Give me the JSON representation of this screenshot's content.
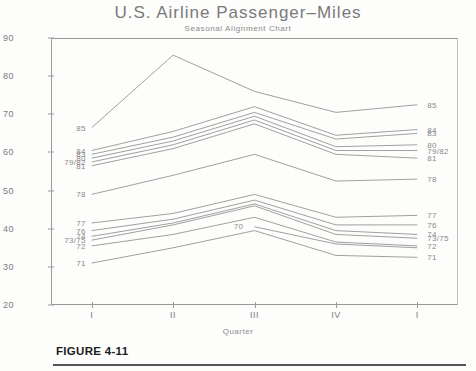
{
  "figure": {
    "caption": "FIGURE 4-11"
  },
  "chart_data": {
    "type": "line",
    "title": "U.S. Airline Passenger–Miles",
    "subtitle": "Seasonal Alignment Chart",
    "xlabel": "Quarter",
    "ylabel": "",
    "grid": false,
    "legend_position": "inline-endpoints",
    "x": [
      "I",
      "II",
      "III",
      "IV",
      "I"
    ],
    "xtick_labels": [
      "I",
      "II",
      "III",
      "IV",
      "I"
    ],
    "ytick_labels": [
      "20",
      "30",
      "40",
      "50",
      "60",
      "70",
      "80",
      "90"
    ],
    "ytick_values": [
      20,
      30,
      40,
      50,
      60,
      70,
      80,
      90
    ],
    "ylim": [
      20,
      90
    ],
    "series": [
      {
        "name": "85",
        "label_left": "85",
        "label_right": "85",
        "values": [
          66.5,
          85.5,
          76.0,
          70.5,
          72.5
        ]
      },
      {
        "name": "84",
        "label_left": "84",
        "label_right": "84",
        "values": [
          60.5,
          65.5,
          72.0,
          64.5,
          66.0
        ]
      },
      {
        "name": "83",
        "label_left": "83",
        "label_right": "83",
        "values": [
          59.5,
          64.0,
          70.5,
          63.5,
          65.0
        ]
      },
      {
        "name": "80",
        "label_left": "80",
        "label_right": "80",
        "values": [
          58.5,
          63.0,
          69.5,
          61.5,
          62.0
        ]
      },
      {
        "name": "79/82",
        "label_left": "79/82",
        "label_right": "79/82",
        "values": [
          57.5,
          62.0,
          68.5,
          60.5,
          60.5
        ]
      },
      {
        "name": "81",
        "label_left": "81",
        "label_right": "81",
        "values": [
          56.5,
          61.0,
          67.5,
          59.5,
          58.5
        ]
      },
      {
        "name": "78",
        "label_left": "78",
        "label_right": "78",
        "values": [
          49.0,
          54.0,
          59.5,
          52.5,
          53.0
        ]
      },
      {
        "name": "77",
        "label_left": "77",
        "label_right": "77",
        "values": [
          41.5,
          44.0,
          49.0,
          43.0,
          43.5
        ]
      },
      {
        "name": "76",
        "label_left": "76",
        "label_right": "76",
        "values": [
          39.5,
          42.5,
          47.5,
          41.0,
          41.0
        ]
      },
      {
        "name": "74",
        "label_left": "74",
        "label_right": "74",
        "values": [
          38.0,
          41.5,
          46.5,
          39.5,
          38.5
        ]
      },
      {
        "name": "73/75",
        "label_left": "73/75",
        "label_right": "73/75",
        "values": [
          37.0,
          41.0,
          46.0,
          38.5,
          37.5
        ]
      },
      {
        "name": "72",
        "label_left": "72",
        "label_right": "72",
        "values": [
          35.5,
          38.5,
          43.0,
          36.5,
          35.5
        ]
      },
      {
        "name": "71",
        "label_left": "71",
        "label_right": "71",
        "values": [
          31.0,
          35.0,
          39.5,
          33.0,
          32.5
        ]
      },
      {
        "name": "70",
        "label_inline": "70",
        "inline_at_index": 2,
        "values": [
          null,
          null,
          40.5,
          36.0,
          35.0
        ]
      }
    ]
  }
}
